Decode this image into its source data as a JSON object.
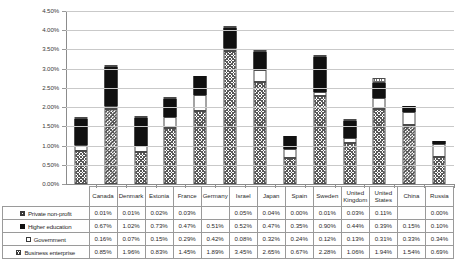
{
  "chart_data": {
    "type": "bar",
    "stacked": true,
    "title": "",
    "xlabel": "",
    "ylabel": "",
    "ylim": [
      0,
      4.5
    ],
    "ytick_labels": [
      "0.00%",
      "0.50%",
      "1.00%",
      "1.50%",
      "2.00%",
      "2.50%",
      "3.00%",
      "3.50%",
      "4.00%",
      "4.50%"
    ],
    "ytick_values": [
      0,
      0.5,
      1.0,
      1.5,
      2.0,
      2.5,
      3.0,
      3.5,
      4.0,
      4.5
    ],
    "grid": true,
    "legend_position": "table-left",
    "value_suffix": "%",
    "categories": [
      "Canada",
      "Denmark",
      "Estonia",
      "France",
      "Germany",
      "Israel",
      "Japan",
      "Spain",
      "Sweden",
      "United Kingdom",
      "United States",
      "China",
      "Russia"
    ],
    "series": [
      {
        "name": "Business enterprise",
        "swatch": "business",
        "values": [
          0.85,
          1.96,
          0.83,
          1.45,
          1.89,
          3.45,
          2.65,
          0.67,
          2.28,
          1.06,
          1.94,
          1.54,
          0.69
        ],
        "labels": [
          "0.85%",
          "1.96%",
          "0.83%",
          "1.45%",
          "1.89%",
          "3.45%",
          "2.65%",
          "0.67%",
          "2.28%",
          "1.06%",
          "1.94%",
          "1.54%",
          "0.69%"
        ]
      },
      {
        "name": "Government",
        "swatch": "government",
        "values": [
          0.16,
          0.07,
          0.15,
          0.29,
          0.42,
          0.08,
          0.32,
          0.24,
          0.12,
          0.13,
          0.31,
          0.33,
          0.34
        ],
        "labels": [
          "0.16%",
          "0.07%",
          "0.15%",
          "0.29%",
          "0.42%",
          "0.08%",
          "0.32%",
          "0.24%",
          "0.12%",
          "0.13%",
          "0.31%",
          "0.33%",
          "0.34%"
        ]
      },
      {
        "name": "Higher education",
        "swatch": "highered",
        "values": [
          0.67,
          1.02,
          0.73,
          0.47,
          0.51,
          0.52,
          0.47,
          0.35,
          0.9,
          0.44,
          0.39,
          0.15,
          0.1
        ],
        "labels": [
          "0.67%",
          "1.02%",
          "0.73%",
          "0.47%",
          "0.51%",
          "0.52%",
          "0.47%",
          "0.35%",
          "0.90%",
          "0.44%",
          "0.39%",
          "0.15%",
          "0.10%"
        ]
      },
      {
        "name": "Private non-profit",
        "swatch": "nonprofit",
        "values": [
          0.01,
          0.01,
          0.02,
          0.03,
          null,
          0.05,
          0.04,
          0.0,
          0.01,
          0.03,
          0.11,
          null,
          0.0
        ],
        "labels": [
          "0.01%",
          "0.01%",
          "0.02%",
          "0.03%",
          "",
          "0.05%",
          "0.04%",
          "0.00%",
          "0.01%",
          "0.03%",
          "0.11%",
          "",
          "0.00%"
        ]
      }
    ],
    "table_row_order": [
      "Private non-profit",
      "Higher education",
      "Government",
      "Business enterprise"
    ],
    "colors": {
      "gridline": "#c9c9c9",
      "axis": "#8c8c8c",
      "higher_education_fill": "#111111",
      "government_fill": "#ffffff",
      "border": "#4a4a4a",
      "text": "#2a2a2a"
    }
  }
}
